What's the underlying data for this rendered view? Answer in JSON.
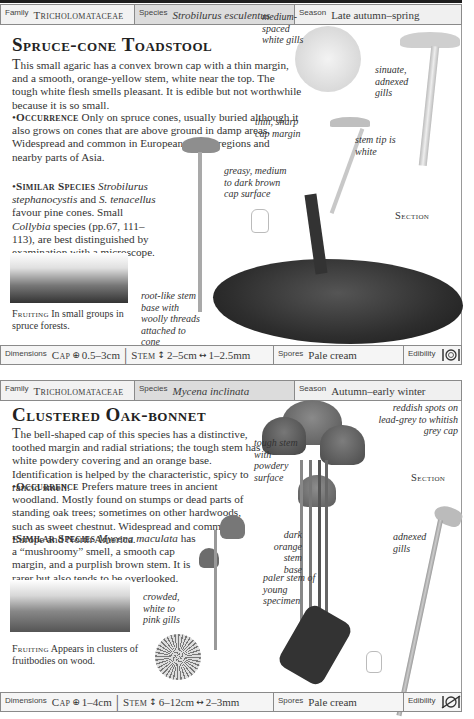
{
  "entries": [
    {
      "info": {
        "family_label": "Family",
        "family": "Tricholomataceae",
        "species_label": "Species",
        "species": "Strobilurus esculentus",
        "season_label": "Season",
        "season": "Late autumn–spring"
      },
      "title": "Spruce-cone Toadstool",
      "intro": "This small agaric has a convex brown cap with a thin margin, and a smooth, orange-yellow stem, white near the top. The tough white flesh smells pleasant. It is edible but not worthwhile because it is so small.",
      "occurrence_heading": "Occurrence",
      "occurrence": "Only on spruce cones, usually buried although it also grows on cones that are above ground in damp areas. Widespread and common in European spruce regions and nearby parts of Asia.",
      "similar_heading": "Similar Species",
      "similar_parts": [
        {
          "t": "Strobilurus stephanocystis",
          "i": true
        },
        {
          "t": " and ",
          "i": false
        },
        {
          "t": "S. tenacellus",
          "i": true
        },
        {
          "t": " favour pine cones. Small ",
          "i": false
        },
        {
          "t": "Collybia",
          "i": true
        },
        {
          "t": " species (pp.67, 111–113), are best distinguished by examination with a microscope.",
          "i": false
        }
      ],
      "fruiting_heading": "Fruiting",
      "fruiting": "In small groups in spruce forests.",
      "annotations": {
        "gills": "medium-spaced white gills",
        "sinuate": "sinuate, adnexed gills",
        "margin": "thin, sharp cap margin",
        "stem_tip": "stem tip is white",
        "cap_surface": "greasy, medium to dark brown cap surface",
        "stem_base": "root-like stem base with woolly threads attached to cone"
      },
      "section_label": "Section",
      "dimensions": {
        "label": "Dimensions",
        "cap_label": "Cap",
        "cap": "0.5–3cm",
        "stem_label": "Stem",
        "stem_height": "2–5cm",
        "stem_width": "1–2.5mm"
      },
      "spores_label": "Spores",
      "spores": "Pale cream",
      "edibility_label": "Edibility",
      "edibility_icon": "edible-icon"
    },
    {
      "info": {
        "family_label": "Family",
        "family": "Tricholomataceae",
        "species_label": "Species",
        "species": "Mycena inclinata",
        "season_label": "Season",
        "season": "Autumn–early winter"
      },
      "title": "Clustered Oak-bonnet",
      "intro": "The bell-shaped cap of this species has a distinctive, toothed margin and radial striations; the tough stem has a white powdery covering and an orange base. Identification is helped by the characteristic, spicy to rancid smell.",
      "occurrence_heading": "Occurrence",
      "occurrence": "Prefers mature trees in ancient woodland. Mostly found on stumps or dead parts of standing oak trees; sometimes on other hardwoods, such as sweet chestnut. Widespread and common in Europe and North America.",
      "similar_heading": "Similar Species",
      "similar_parts": [
        {
          "t": "Mycena maculata",
          "i": true
        },
        {
          "t": " has a “mushroomy” smell, a smooth cap margin, and a purplish brown stem. It is rarer but also tends to be overlooked.",
          "i": false
        }
      ],
      "fruiting_heading": "Fruiting",
      "fruiting": "Appears in clusters of fruitbodies on wood.",
      "annotations": {
        "spots": "reddish spots on lead-grey to whitish grey cap",
        "tough_stem": "tough stem with powdery surface",
        "dark_base": "dark orange stem base",
        "paler_stem": "paler stem of young specimen",
        "crowded": "crowded, white to pink gills",
        "adnexed": "adnexed gills"
      },
      "section_label": "Section",
      "dimensions": {
        "label": "Dimensions",
        "cap_label": "Cap",
        "cap": "1–4cm",
        "stem_label": "Stem",
        "stem_height": "6–12cm",
        "stem_width": "2–3mm"
      },
      "spores_label": "Spores",
      "spores": "Pale cream",
      "edibility_label": "Edibility",
      "edibility_icon": "inedible-icon"
    }
  ]
}
